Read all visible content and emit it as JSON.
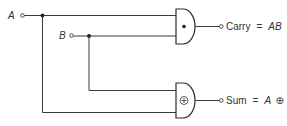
{
  "diagram": {
    "type": "half-adder logic circuit",
    "inputs": [
      {
        "id": "A",
        "label": "A"
      },
      {
        "id": "B",
        "label": "B"
      }
    ],
    "gates": [
      {
        "id": "and-gate",
        "kind": "AND",
        "symbol": "•",
        "output_label": "Carry",
        "equals": "=",
        "expression": "AB"
      },
      {
        "id": "xor-gate",
        "kind": "XOR",
        "symbol": "⊕",
        "output_label": "Sum",
        "equals": "=",
        "expression_a": "A",
        "expression_op": "⊕",
        "expression_b": "B"
      }
    ]
  },
  "labels": {
    "input_a": "A",
    "input_b": "B",
    "and_symbol": "•",
    "xor_symbol": "⊕",
    "carry_word": "Carry",
    "carry_eq": "=",
    "carry_expr": "AB",
    "sum_word": "Sum",
    "sum_eq": "=",
    "sum_a": "A",
    "sum_op": "⊕",
    "sum_b": "B"
  },
  "colors": {
    "line": "#3a3a3a",
    "text": "#333333",
    "background": "#ffffff"
  }
}
